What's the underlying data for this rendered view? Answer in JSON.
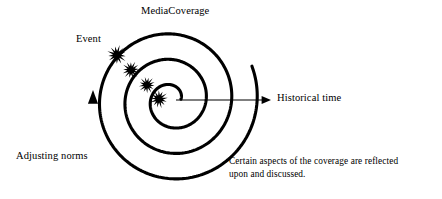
{
  "diagram": {
    "title": "MediaCoverage",
    "type": "spiral-process-diagram",
    "width": 442,
    "height": 199,
    "background_color": "#ffffff",
    "stroke_color": "#000000"
  },
  "labels": {
    "title": "MediaCoverage",
    "event": "Event",
    "historical_time": "Historical time",
    "adjusting_norms": "Adjusting norms",
    "caption_line_1": "Certain aspects of the coverage are reflected",
    "caption_line_2": "upon and discussed."
  },
  "spiral": {
    "center_x": 172,
    "center_y": 100,
    "start_radius": 9,
    "radius_growth_per_turn": 25.5,
    "turns": 3.05,
    "start_angle_deg": 5,
    "direction": "counterclockwise",
    "stroke_width": 3.1,
    "stroke_color": "#000000",
    "arrow_head": {
      "tip_x": 93,
      "tip_y": 90,
      "direction": "up",
      "size": 11
    }
  },
  "time_axis": {
    "x1": 176,
    "y1": 100,
    "x2": 271,
    "y2": 100,
    "stroke_width": 1.2,
    "stroke_color": "#000000",
    "arrow_head_size": 5.5,
    "label": "Historical time"
  },
  "event_markers": [
    {
      "id": "event-marker-1",
      "cx": 117,
      "cy": 55,
      "radius": 9.5,
      "points": 13,
      "inner_ratio": 0.42,
      "rotation_deg": 8
    },
    {
      "id": "event-marker-2",
      "cx": 131,
      "cy": 70,
      "radius": 8.6,
      "points": 13,
      "inner_ratio": 0.42,
      "rotation_deg": 20
    },
    {
      "id": "event-marker-3",
      "cx": 147,
      "cy": 85,
      "radius": 8.2,
      "points": 13,
      "inner_ratio": 0.42,
      "rotation_deg": 33
    },
    {
      "id": "event-marker-4",
      "cx": 159,
      "cy": 99,
      "radius": 8.8,
      "points": 13,
      "inner_ratio": 0.42,
      "rotation_deg": 47
    }
  ],
  "colors": {
    "ink": "#000000",
    "paper": "#ffffff"
  }
}
